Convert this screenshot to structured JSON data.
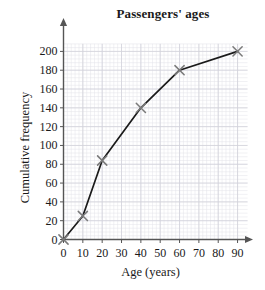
{
  "chart_data": {
    "type": "line",
    "title": "Passengers' ages",
    "xlabel": "Age (years)",
    "ylabel": "Cumulative frequency",
    "x": [
      0,
      10,
      20,
      40,
      60,
      90
    ],
    "values": [
      0,
      25,
      84,
      140,
      180,
      200
    ],
    "points": [
      {
        "x": 0,
        "y": 0
      },
      {
        "x": 10,
        "y": 25
      },
      {
        "x": 20,
        "y": 84
      },
      {
        "x": 40,
        "y": 140
      },
      {
        "x": 60,
        "y": 180
      },
      {
        "x": 90,
        "y": 200
      }
    ],
    "xlim": [
      0,
      95
    ],
    "ylim": [
      0,
      210
    ],
    "xticks": [
      0,
      10,
      20,
      30,
      40,
      50,
      60,
      70,
      80,
      90
    ],
    "yticks": [
      0,
      20,
      40,
      60,
      80,
      100,
      120,
      140,
      160,
      180,
      200
    ],
    "xtick_labels": [
      "0",
      "10",
      "20",
      "30",
      "40",
      "50",
      "60",
      "70",
      "80",
      "90"
    ],
    "ytick_labels": [
      "0",
      "20",
      "40",
      "60",
      "80",
      "100",
      "120",
      "140",
      "160",
      "180",
      "200"
    ],
    "grid": true,
    "grid_minor": true,
    "legend": null,
    "marker": "x-cross",
    "marker_color": "#7a7a7a",
    "line_color": "#1a1a1a",
    "grid_color": "#e2e2e8",
    "grid_major_color": "#d2d2da",
    "axis_color": "#555555",
    "background": "#ffffff"
  }
}
